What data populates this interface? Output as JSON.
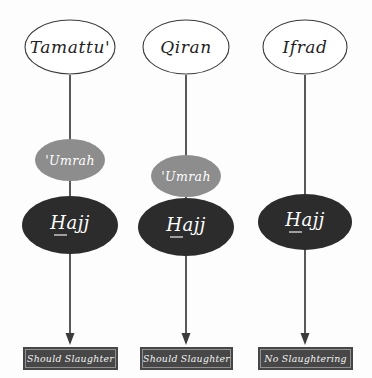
{
  "diagram": {
    "background_color": "#fdfdfd",
    "colors": {
      "top_node_fill": "#ffffff",
      "top_node_stroke": "#3a3a3a",
      "umrah_fill": "#8d8d8d",
      "hajj_fill": "#2c2c2c",
      "box_fill": "#474747",
      "box_border": "#9a9a9a",
      "connector": "#3b3b3b",
      "light_text": "#ffffff",
      "dark_text": "#1f1f1f"
    },
    "columns": [
      {
        "id": "tamattu",
        "top_label": "Tamattu'",
        "umrah_label": "'Umrah",
        "hajj_label": "Hajj",
        "outcome_label": "Should Slaughter"
      },
      {
        "id": "qiran",
        "top_label": "Qiran",
        "umrah_label": "'Umrah",
        "hajj_label": "Hajj",
        "outcome_label": "Should Slaughter"
      },
      {
        "id": "ifrad",
        "top_label": "Ifrad",
        "umrah_label": null,
        "hajj_label": "Hajj",
        "outcome_label": "No Slaughtering"
      }
    ]
  }
}
